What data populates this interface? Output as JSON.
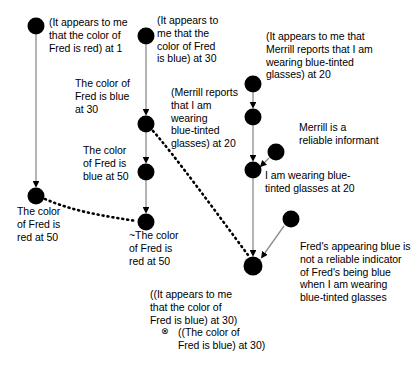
{
  "diagram": {
    "colors": {
      "node_fill": "#000000",
      "support_edge": "#8c8c8c",
      "defeat_edge": "#000000",
      "background": "#ffffff",
      "text": "#000000"
    },
    "nodes": [
      {
        "id": "n1",
        "cx": 36,
        "cy": 26,
        "r": 8.5,
        "label_ref": "L1"
      },
      {
        "id": "n2",
        "cx": 36,
        "cy": 196,
        "r": 8.5,
        "label_ref": "L5"
      },
      {
        "id": "n3",
        "cx": 146,
        "cy": 36,
        "r": 8.5,
        "label_ref": "L2"
      },
      {
        "id": "n4",
        "cx": 146,
        "cy": 124,
        "r": 8.5,
        "label_ref": "L3"
      },
      {
        "id": "n5",
        "cx": 146,
        "cy": 172,
        "r": 8.5,
        "label_ref": "L4"
      },
      {
        "id": "n6",
        "cx": 146,
        "cy": 222,
        "r": 8.5,
        "label_ref": "L6"
      },
      {
        "id": "n7",
        "cx": 253,
        "cy": 84,
        "r": 8.5,
        "label_ref": "L7"
      },
      {
        "id": "n8",
        "cx": 253,
        "cy": 117,
        "r": 8.5,
        "label_ref": "L8"
      },
      {
        "id": "n9",
        "cx": 276,
        "cy": 152,
        "r": 8.5,
        "label_ref": "L9"
      },
      {
        "id": "n10",
        "cx": 253,
        "cy": 170,
        "r": 8.5,
        "label_ref": "L10"
      },
      {
        "id": "n11",
        "cx": 291,
        "cy": 219,
        "r": 8.5,
        "label_ref": "L12"
      },
      {
        "id": "n12",
        "cx": 253,
        "cy": 266,
        "r": 9.5,
        "label_ref": "L11"
      }
    ],
    "edges": [
      {
        "from": "n1",
        "to": "n2",
        "type": "support"
      },
      {
        "from": "n3",
        "to": "n4",
        "type": "support"
      },
      {
        "from": "n4",
        "to": "n5",
        "type": "support"
      },
      {
        "from": "n5",
        "to": "n6",
        "type": "support"
      },
      {
        "from": "n7",
        "to": "n8",
        "type": "support"
      },
      {
        "from": "n8",
        "to": "n10",
        "type": "support"
      },
      {
        "from": "n9",
        "to": "n10",
        "type": "support"
      },
      {
        "from": "n10",
        "to": "n12",
        "type": "support"
      },
      {
        "from": "n11",
        "to": "n12",
        "type": "support"
      },
      {
        "from": "n2",
        "to": "n6",
        "type": "defeat"
      },
      {
        "from": "n4",
        "to": "n12",
        "type": "defeat"
      }
    ],
    "labels": {
      "L1": "(It appears to me\nthat the color of\nFred is red) at 1",
      "L2": "(It appears to\nme that the\ncolor of Fred\nis blue) at 30",
      "L3": "The color of\nFred is blue\nat 30",
      "L4": "The color\nof Fred is\nblue at 50",
      "L5": "The color\nof Fred is\nred at 50",
      "L6": "~The color\nof Fred is\nred at 50",
      "L7": "(It appears to me that\nMerrill reports that I am\nwearing blue-tinted\nglasses) at 20",
      "L8": "(Merrill reports\nthat I am\nwearing\nblue-tinted\nglasses) at 20",
      "L9": "Merrill is a\nreliable informant",
      "L10": "I am wearing blue-\ntinted glasses at 20",
      "L11": "((It appears to me\nthat the color of\nFred is blue) at 30)",
      "L11b": "((The color of\nFred is blue) at 30)",
      "L11_symbol": "⊗",
      "L12": "Fred's appearing blue is\nnot a reliable indicator\nof Fred's being blue\nwhen I am wearing\nblue-tinted glasses"
    }
  }
}
